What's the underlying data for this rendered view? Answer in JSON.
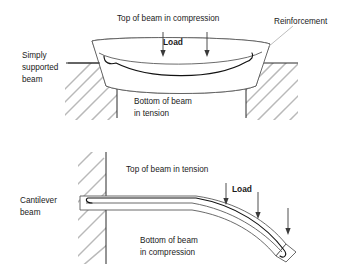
{
  "top_diagram": {
    "name": "simply-supported-beam",
    "side_label_line1": "Simply",
    "side_label_line2": "supported",
    "side_label_line3": "beam",
    "top_label": "Top of beam in compression",
    "load_label": "Load",
    "bottom_label_line1": "Bottom of beam",
    "bottom_label_line2": "in tension",
    "reinforcement_label": "Reinforcement",
    "load_arrow_count": 2
  },
  "bottom_diagram": {
    "name": "cantilever-beam",
    "side_label_line1": "Cantilever",
    "side_label_line2": "beam",
    "top_label": "Top of beam in tension",
    "load_label": "Load",
    "bottom_label_line1": "Bottom of beam",
    "bottom_label_line2": "in compression",
    "load_arrow_count": 3
  },
  "colors": {
    "background": "#ffffff",
    "text": "#1a1a1a",
    "beam_outline": "#5a5a5a",
    "rebar": "#121212",
    "hatch": "#b9b9b9",
    "ground": "#2b2b2b",
    "arrow": "#3a3a3a",
    "leader": "#b5b5b5"
  }
}
